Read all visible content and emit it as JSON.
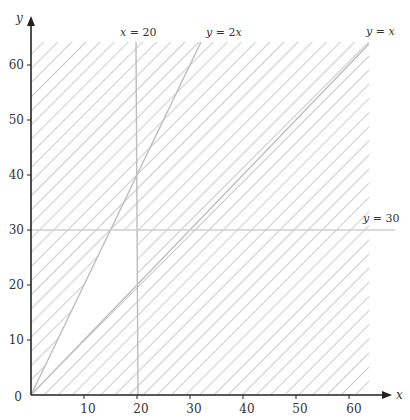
{
  "title": "",
  "axes": {
    "x_label": "x",
    "y_label": "y",
    "x_ticks": [
      "10",
      "20",
      "30",
      "40",
      "50",
      "60"
    ],
    "y_ticks": [
      "0",
      "10",
      "20",
      "30",
      "40",
      "50",
      "60"
    ]
  },
  "lines": [
    {
      "id": "x20",
      "label_var": "x",
      "label_rest": " = 20"
    },
    {
      "id": "y2x",
      "label_var": "y",
      "label_mid": " = 2",
      "label_var2": "x"
    },
    {
      "id": "yx",
      "label_var": "y",
      "label_mid": " = ",
      "label_var2": "x"
    },
    {
      "id": "y30",
      "label_var": "y",
      "label_rest": " = 30"
    }
  ],
  "region": {
    "description": "Unshaded feasible region bounded by y = 2x, x = 20, y = 30 and y = x",
    "vertices": [
      [
        0,
        0
      ],
      [
        15,
        30
      ],
      [
        20,
        30
      ],
      [
        20,
        20
      ]
    ]
  },
  "colors": {
    "axis": "#222222",
    "constraint_line": "#bdbdbd",
    "hatch": "#a8a8a8",
    "text": "#333333"
  }
}
